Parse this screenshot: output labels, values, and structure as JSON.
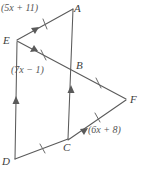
{
  "figure": {
    "type": "geometry-diagram",
    "stroke_color": "#5a5a5a",
    "text_color": "#4a4a4a",
    "background_color": "#ffffff",
    "vertices": [
      {
        "name": "A",
        "label": "A",
        "x": 74,
        "y": 10
      },
      {
        "name": "E",
        "label": "E",
        "x": 9,
        "y": 41
      },
      {
        "name": "B",
        "label": "B",
        "x": 74,
        "y": 66
      },
      {
        "name": "F",
        "label": "F",
        "x": 127,
        "y": 100
      },
      {
        "name": "C",
        "label": "C",
        "x": 68,
        "y": 142
      },
      {
        "name": "D",
        "label": "D",
        "x": 9,
        "y": 162
      }
    ],
    "expressions": [
      {
        "name": "side-EA-expression",
        "text": "(5x + 11)",
        "x": 2,
        "y": 4
      },
      {
        "name": "side-EB-expression",
        "text": "(7x − 1)",
        "x": 12,
        "y": 66
      },
      {
        "name": "side-CF-expression",
        "text": "(6x + 8)",
        "x": 89,
        "y": 126
      }
    ],
    "segments": [
      {
        "name": "segment-EA",
        "from": "E",
        "to": "A",
        "ticks": 0,
        "arrows": 1
      },
      {
        "name": "segment-AB",
        "from": "A",
        "to": "B",
        "ticks": 0,
        "arrows": 1
      },
      {
        "name": "segment-EB",
        "from": "E",
        "to": "B",
        "ticks": 1,
        "arrows": 1
      },
      {
        "name": "segment-BF",
        "from": "B",
        "to": "F",
        "ticks": 1,
        "arrows": 0
      },
      {
        "name": "segment-CF",
        "from": "C",
        "to": "F",
        "ticks": 1,
        "arrows": 1
      },
      {
        "name": "segment-BC",
        "from": "B",
        "to": "C",
        "ticks": 0,
        "arrows": 1
      },
      {
        "name": "segment-ED",
        "from": "E",
        "to": "D",
        "ticks": 0,
        "arrows": 1
      },
      {
        "name": "segment-DC",
        "from": "D",
        "to": "C",
        "ticks": 1,
        "arrows": 0
      }
    ]
  }
}
